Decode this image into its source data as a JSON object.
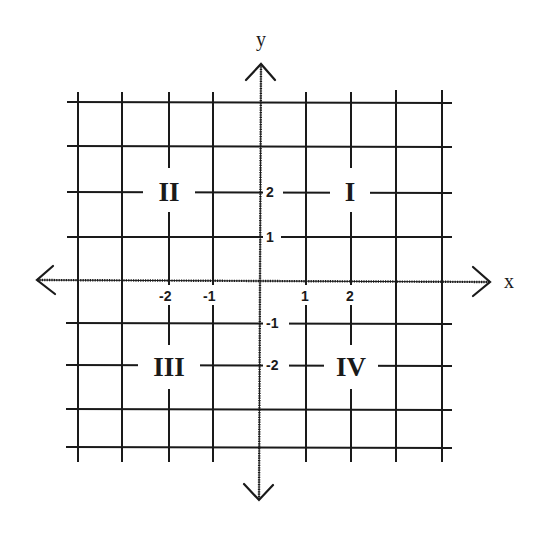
{
  "diagram": {
    "axes": {
      "x_label": "x",
      "y_label": "y"
    },
    "x_ticks": [
      {
        "value": -2,
        "label": "-2"
      },
      {
        "value": -1,
        "label": "-1"
      },
      {
        "value": 1,
        "label": "1"
      },
      {
        "value": 2,
        "label": "2"
      }
    ],
    "y_ticks": [
      {
        "value": 2,
        "label": "2"
      },
      {
        "value": 1,
        "label": "1"
      },
      {
        "value": -1,
        "label": "-1"
      },
      {
        "value": -2,
        "label": "-2"
      }
    ],
    "quadrants": {
      "q1": "I",
      "q2": "II",
      "q3": "III",
      "q4": "IV"
    },
    "grid": {
      "x_range": [
        -4,
        4
      ],
      "y_range": [
        -4,
        4
      ],
      "cells_per_side": 8
    },
    "colors": {
      "line": "#1a1a1a",
      "background": "#ffffff"
    }
  }
}
